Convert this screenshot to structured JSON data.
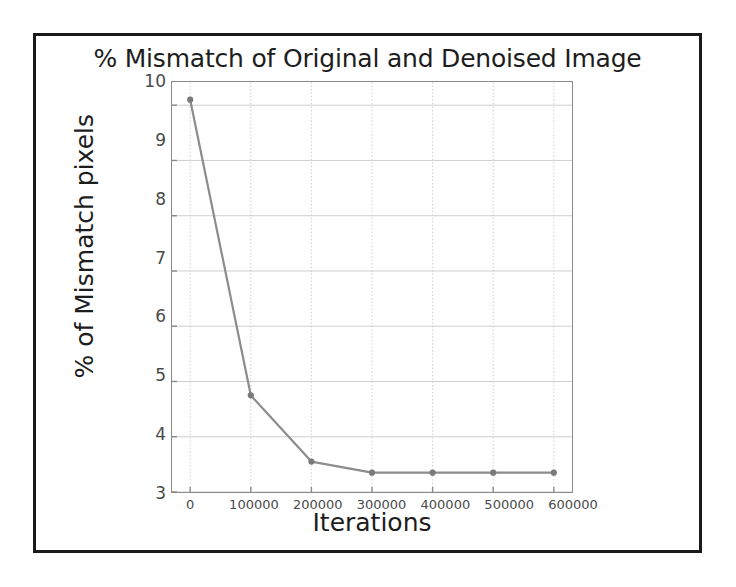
{
  "figure": {
    "title": "% Mismatch of Original and Denoised Image",
    "border_color": "#1a1a1a",
    "background": "#ffffff"
  },
  "chart_data": {
    "type": "line",
    "title": "% Mismatch of Original and Denoised Image",
    "xlabel": "Iterations",
    "ylabel": "% of Mismatch pixels",
    "x": [
      0,
      100000,
      200000,
      300000,
      400000,
      500000,
      600000
    ],
    "values": [
      10.1,
      4.75,
      3.55,
      3.35,
      3.35,
      3.35,
      3.35
    ],
    "series": [
      {
        "name": "% of Mismatch pixels",
        "values": [
          10.1,
          4.75,
          3.55,
          3.35,
          3.35,
          3.35,
          3.35
        ]
      }
    ],
    "xlim": [
      -30000,
      630000
    ],
    "ylim": [
      3,
      10.42
    ],
    "xticks": [
      0,
      100000,
      200000,
      300000,
      400000,
      500000,
      600000
    ],
    "xtick_labels": [
      "0",
      "100000",
      "200000",
      "300000",
      "400000",
      "500000",
      "600000"
    ],
    "yticks": [
      3,
      4,
      5,
      6,
      7,
      8,
      9,
      10
    ],
    "ytick_labels": [
      "3",
      "4",
      "5",
      "6",
      "7",
      "8",
      "9",
      "10"
    ],
    "grid": true,
    "grid_color": "#cfcfcf",
    "legend": "none",
    "line_color": "#8c8c8c",
    "marker": "circle",
    "marker_color": "#7a7a7a",
    "axis_color": "#8a8a8a"
  }
}
